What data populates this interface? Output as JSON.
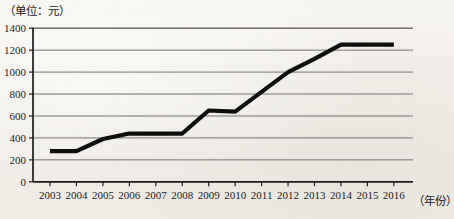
{
  "unit_label": "（单位：元）",
  "xaxis_title": "（年份）",
  "chart_data": {
    "type": "line",
    "title": "",
    "subtitle": "",
    "xlabel": "（年份）",
    "ylabel": "（单位：元）",
    "categories": [
      "2003",
      "2004",
      "2005",
      "2006",
      "2007",
      "2008",
      "2009",
      "2010",
      "2011",
      "2012",
      "2013",
      "2014",
      "2015",
      "2016"
    ],
    "values": [
      280,
      280,
      390,
      440,
      440,
      440,
      650,
      640,
      820,
      1000,
      1120,
      1250,
      1250,
      1250
    ],
    "ylim": [
      0,
      1400
    ],
    "ytick_labels": [
      "0",
      "200",
      "400",
      "600",
      "800",
      "1000",
      "1200",
      "1400"
    ],
    "ytick_values": [
      0,
      200,
      400,
      600,
      800,
      1000,
      1200,
      1400
    ],
    "grid": true,
    "legend": "none",
    "series": [
      {
        "name": "",
        "color": "#0d0d0d",
        "values": [
          280,
          280,
          390,
          440,
          440,
          440,
          650,
          640,
          820,
          1000,
          1120,
          1250,
          1250,
          1250
        ]
      }
    ]
  },
  "axes": {
    "y_ticks": [
      {
        "label": "1400",
        "value": 1400
      },
      {
        "label": "1200",
        "value": 1200
      },
      {
        "label": "1000",
        "value": 1000
      },
      {
        "label": "800",
        "value": 800
      },
      {
        "label": "600",
        "value": 600
      },
      {
        "label": "400",
        "value": 400
      },
      {
        "label": "200",
        "value": 200
      },
      {
        "label": "0",
        "value": 0
      }
    ],
    "x_ticks": [
      {
        "label": "2003"
      },
      {
        "label": "2004"
      },
      {
        "label": "2005"
      },
      {
        "label": "2006"
      },
      {
        "label": "2007"
      },
      {
        "label": "2008"
      },
      {
        "label": "2009"
      },
      {
        "label": "2010"
      },
      {
        "label": "2011"
      },
      {
        "label": "2012"
      },
      {
        "label": "2013"
      },
      {
        "label": "2014"
      },
      {
        "label": "2015"
      },
      {
        "label": "2016"
      }
    ]
  }
}
